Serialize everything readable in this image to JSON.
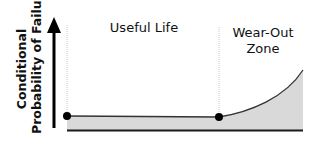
{
  "diagram": {
    "y_axis": {
      "label_line1": "Conditional",
      "label_line2": "Probability of Failure"
    },
    "regions": [
      {
        "label": "Useful Life"
      },
      {
        "label_line1": "Wear-Out",
        "label_line2": "Zone"
      }
    ],
    "curve": {
      "description": "Flat conditional probability during useful life, then rising exponentially in the wear-out zone",
      "points": [
        {
          "x": 67,
          "y": 116
        },
        {
          "x": 219,
          "y": 117
        },
        {
          "x": 303,
          "y": 70
        }
      ],
      "markers": [
        {
          "name": "start-of-life",
          "x": 67,
          "y": 116
        },
        {
          "name": "start-of-wear-out",
          "x": 219,
          "y": 117
        }
      ]
    },
    "colors": {
      "fill": "#d9d9d9",
      "line": "#222222",
      "guide": "#c8c8c8",
      "marker": "#000000"
    }
  }
}
